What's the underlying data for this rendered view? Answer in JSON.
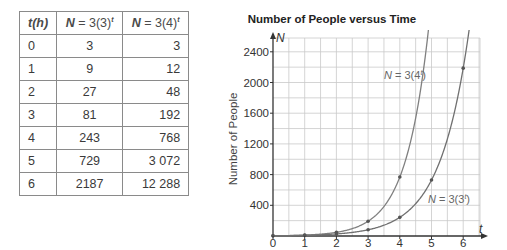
{
  "table": {
    "headers": [
      "t(h)",
      "N = 3(3)^t",
      "N = 3(4)^t"
    ],
    "rows": [
      [
        "0",
        "3",
        "3"
      ],
      [
        "1",
        "9",
        "12"
      ],
      [
        "2",
        "27",
        "48"
      ],
      [
        "3",
        "81",
        "192"
      ],
      [
        "4",
        "243",
        "768"
      ],
      [
        "5",
        "729",
        "3 072"
      ],
      [
        "6",
        "2187",
        "12 288"
      ]
    ]
  },
  "chart_data": {
    "type": "line",
    "title": "Number of People versus Time",
    "xlabel": "t",
    "ylabel": "Number of People",
    "y_axis_symbol": "N",
    "x": [
      0,
      1,
      2,
      3,
      4,
      5,
      6
    ],
    "x_ticks": [
      "0",
      "1",
      "2",
      "3",
      "4",
      "5",
      "6"
    ],
    "y_ticks": [
      "400",
      "800",
      "1200",
      "1600",
      "2000",
      "2400"
    ],
    "xlim": [
      0,
      6.5
    ],
    "ylim": [
      0,
      2600
    ],
    "grid": true,
    "series": [
      {
        "name": "N = 3(4^t)",
        "values": [
          3,
          12,
          48,
          192,
          768,
          3072,
          12288
        ],
        "color": "#808080"
      },
      {
        "name": "N = 3(3^t)",
        "values": [
          3,
          9,
          27,
          81,
          243,
          729,
          2187
        ],
        "color": "#707070"
      }
    ],
    "annotations": [
      {
        "text": "N = 3(4^t)",
        "near": "upper curve at t≈4.5"
      },
      {
        "text": "N = 3(3^t)",
        "near": "lower curve at t≈5.7"
      }
    ]
  }
}
